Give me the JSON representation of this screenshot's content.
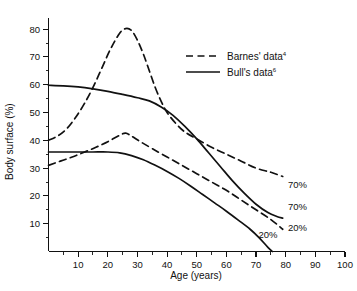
{
  "chart_data": {
    "type": "line",
    "title": "",
    "xlabel": "Age  (years)",
    "ylabel": "Body surface (%)",
    "xlim": [
      0,
      100
    ],
    "ylim": [
      0,
      84
    ],
    "grid": false,
    "legend_position": "upper-right-inside",
    "x_ticks": [
      10,
      20,
      30,
      40,
      50,
      60,
      70,
      80,
      90,
      100
    ],
    "x_tick_labels": [
      "10",
      "20",
      "30",
      "40",
      "50",
      "60",
      "70",
      "80",
      "90",
      "100"
    ],
    "x_minor_ticks": [
      5,
      15,
      25,
      35,
      45,
      55,
      65,
      75,
      85,
      95
    ],
    "y_ticks": [
      10,
      20,
      30,
      40,
      50,
      60,
      70,
      80
    ],
    "y_tick_labels": [
      "10",
      "20",
      "30",
      "40",
      "50",
      "60",
      "70",
      "80"
    ],
    "y_minor_ticks": [
      5,
      15,
      25,
      35,
      45,
      55,
      65,
      75
    ],
    "series": [
      {
        "name": "Barnes' data — 70%",
        "source": "Barnes",
        "level": "70%",
        "style": "dashed",
        "label": "70%",
        "label_x": 84,
        "label_y": 23,
        "points": [
          [
            0,
            40
          ],
          [
            3,
            41.5
          ],
          [
            6,
            44
          ],
          [
            9,
            48
          ],
          [
            12,
            53
          ],
          [
            15,
            59
          ],
          [
            18,
            66
          ],
          [
            21,
            73
          ],
          [
            24,
            78.5
          ],
          [
            26,
            80.2
          ],
          [
            28,
            79.5
          ],
          [
            30,
            76
          ],
          [
            32,
            71
          ],
          [
            34,
            65
          ],
          [
            36,
            59
          ],
          [
            38,
            54
          ],
          [
            40,
            50
          ],
          [
            43,
            46
          ],
          [
            46,
            43
          ],
          [
            50,
            40.5
          ],
          [
            55,
            37.5
          ],
          [
            60,
            35
          ],
          [
            65,
            32.5
          ],
          [
            70,
            30
          ],
          [
            75,
            28.5
          ],
          [
            79,
            27
          ]
        ]
      },
      {
        "name": "Bull's data — 70%",
        "source": "Bull",
        "level": "70%",
        "style": "solid",
        "label": "70%",
        "label_x": 84,
        "label_y": 15,
        "points": [
          [
            0,
            59.8
          ],
          [
            5,
            59.6
          ],
          [
            10,
            59.2
          ],
          [
            15,
            58.5
          ],
          [
            20,
            57.6
          ],
          [
            25,
            56.5
          ],
          [
            30,
            55.3
          ],
          [
            34,
            54.2
          ],
          [
            38,
            52
          ],
          [
            42,
            49
          ],
          [
            46,
            45
          ],
          [
            50,
            40.5
          ],
          [
            54,
            35.5
          ],
          [
            58,
            30.5
          ],
          [
            62,
            25.5
          ],
          [
            66,
            21
          ],
          [
            70,
            17
          ],
          [
            74,
            14
          ],
          [
            77,
            12.6
          ],
          [
            79,
            12
          ]
        ]
      },
      {
        "name": "Barnes' data — 20%",
        "source": "Barnes",
        "level": "20%",
        "style": "dashed",
        "label": "20%",
        "label_x": 84,
        "label_y": 7.5,
        "points": [
          [
            0,
            31
          ],
          [
            4,
            32.5
          ],
          [
            8,
            34
          ],
          [
            12,
            35.7
          ],
          [
            16,
            37.5
          ],
          [
            20,
            39.5
          ],
          [
            24,
            41.8
          ],
          [
            26,
            42.6
          ],
          [
            28,
            41.5
          ],
          [
            31,
            39.5
          ],
          [
            35,
            37
          ],
          [
            40,
            34
          ],
          [
            45,
            31
          ],
          [
            50,
            28
          ],
          [
            55,
            25
          ],
          [
            60,
            22
          ],
          [
            65,
            18.5
          ],
          [
            70,
            15
          ],
          [
            75,
            11.5
          ],
          [
            79,
            8
          ]
        ]
      },
      {
        "name": "Bull's data — 20%",
        "source": "Bull",
        "level": "20%",
        "style": "solid",
        "label": "20%",
        "label_x": 74,
        "label_y": 5,
        "points": [
          [
            0,
            35.8
          ],
          [
            5,
            35.8
          ],
          [
            10,
            35.8
          ],
          [
            15,
            35.8
          ],
          [
            20,
            35.8
          ],
          [
            24,
            35.5
          ],
          [
            28,
            34.5
          ],
          [
            32,
            33
          ],
          [
            36,
            31
          ],
          [
            40,
            28.8
          ],
          [
            44,
            26.3
          ],
          [
            48,
            23.5
          ],
          [
            52,
            20.5
          ],
          [
            56,
            17.5
          ],
          [
            60,
            14.5
          ],
          [
            64,
            11.3
          ],
          [
            68,
            8
          ],
          [
            71,
            5
          ],
          [
            74,
            1.5
          ],
          [
            75.5,
            0
          ]
        ]
      }
    ],
    "legend": [
      {
        "label": "Barnes' data",
        "superscript": "4",
        "style": "dashed"
      },
      {
        "label": "Bull's data",
        "superscript": "6",
        "style": "solid"
      }
    ]
  }
}
